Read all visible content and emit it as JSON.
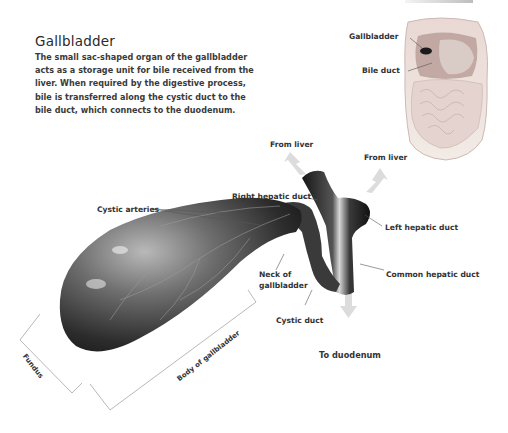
{
  "header": {
    "title": "Gallbladder",
    "description": "The small sac-shaped organ of the gallbladder acts as a storage unit for bile received from the liver. When required by the digestive process, bile is transferred along the cystic duct to the bile duct, which connects to the duodenum."
  },
  "inset": {
    "labels": {
      "gallbladder": "Gallbladder",
      "bile_duct": "Bile duct"
    }
  },
  "main_diagram": {
    "labels": {
      "from_liver_left": "From liver",
      "from_liver_right": "From liver",
      "right_hepatic_duct": "Right hepatic duct",
      "left_hepatic_duct": "Left hepatic duct",
      "cystic_arteries": "Cystic arteries",
      "neck_line1": "Neck of",
      "neck_line2": "gallbladder",
      "common_hepatic_duct": "Common hepatic duct",
      "cystic_duct": "Cystic duct",
      "to_duodenum": "To duodenum",
      "fundus": "Fundus",
      "body": "Body of gallbladder"
    },
    "colors": {
      "organ_dark": "#1e1e1e",
      "organ_mid": "#5a5a5a",
      "organ_light": "#bdbdbd",
      "arrow": "#d9d9d9",
      "leader_line": "#555555",
      "bracket": "#9a9a9a"
    }
  }
}
